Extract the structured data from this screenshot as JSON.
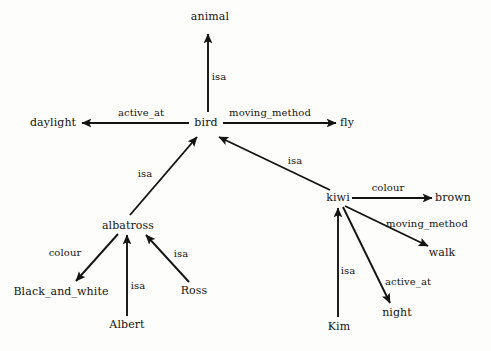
{
  "diagram": {
    "type": "semantic-network",
    "background_color": "#fdfdfb",
    "ink_color": "#141414",
    "nodes": [
      {
        "id": "animal",
        "label": "animal",
        "x": 210,
        "y": 17
      },
      {
        "id": "daylight",
        "label": "daylight",
        "x": 53,
        "y": 123
      },
      {
        "id": "bird",
        "label": "bird",
        "x": 206,
        "y": 123
      },
      {
        "id": "fly",
        "label": "fly",
        "x": 347,
        "y": 123
      },
      {
        "id": "albatross",
        "label": "albatross",
        "x": 128,
        "y": 226
      },
      {
        "id": "kiwi",
        "label": "kiwi",
        "x": 338,
        "y": 198
      },
      {
        "id": "brown",
        "label": "brown",
        "x": 453,
        "y": 198
      },
      {
        "id": "walk",
        "label": "walk",
        "x": 442,
        "y": 253
      },
      {
        "id": "night",
        "label": "night",
        "x": 397,
        "y": 313
      },
      {
        "id": "black_and_white",
        "label": "Black_and_white",
        "x": 61,
        "y": 292
      },
      {
        "id": "ross",
        "label": "Ross",
        "x": 194,
        "y": 291
      },
      {
        "id": "albert",
        "label": "Albert",
        "x": 127,
        "y": 325
      },
      {
        "id": "kim",
        "label": "Kim",
        "x": 339,
        "y": 327
      }
    ],
    "edges": [
      {
        "id": "bird-isa-animal",
        "from": "bird",
        "to": "animal",
        "label": "isa",
        "label_x": 219,
        "label_y": 76,
        "x1": 208,
        "y1": 112,
        "x2": 208,
        "y2": 34
      },
      {
        "id": "bird-activeat-daylight",
        "from": "bird",
        "to": "daylight",
        "label": "active_at",
        "label_x": 141,
        "label_y": 112,
        "x1": 189,
        "y1": 123,
        "x2": 82,
        "y2": 123
      },
      {
        "id": "bird-movingmethod-fly",
        "from": "bird",
        "to": "fly",
        "label": "moving_method",
        "label_x": 270,
        "label_y": 112,
        "x1": 223,
        "y1": 123,
        "x2": 336,
        "y2": 123
      },
      {
        "id": "albatross-isa-bird",
        "from": "albatross",
        "to": "bird",
        "label": "isa",
        "label_x": 145,
        "label_y": 173,
        "x1": 130,
        "y1": 215,
        "x2": 197,
        "y2": 137
      },
      {
        "id": "kiwi-isa-bird",
        "from": "kiwi",
        "to": "bird",
        "label": "isa",
        "label_x": 295,
        "label_y": 160,
        "x1": 330,
        "y1": 190,
        "x2": 219,
        "y2": 137
      },
      {
        "id": "kiwi-colour-brown",
        "from": "kiwi",
        "to": "brown",
        "label": "colour",
        "label_x": 388,
        "label_y": 187,
        "x1": 352,
        "y1": 198,
        "x2": 432,
        "y2": 198
      },
      {
        "id": "kiwi-movingmethod-walk",
        "from": "kiwi",
        "to": "walk",
        "label": "moving_method",
        "label_x": 427,
        "label_y": 223,
        "x1": 345,
        "y1": 206,
        "x2": 428,
        "y2": 246
      },
      {
        "id": "kiwi-activeat-night",
        "from": "kiwi",
        "to": "night",
        "label": "active_at",
        "label_x": 408,
        "label_y": 281,
        "x1": 343,
        "y1": 207,
        "x2": 390,
        "y2": 303
      },
      {
        "id": "kim-isa-kiwi",
        "from": "kim",
        "to": "kiwi",
        "label": "isa",
        "label_x": 348,
        "label_y": 270,
        "x1": 338,
        "y1": 317,
        "x2": 338,
        "y2": 208
      },
      {
        "id": "albatross-colour-blackwhite",
        "from": "albatross",
        "to": "black_and_white",
        "label": "colour",
        "label_x": 65,
        "label_y": 252,
        "x1": 118,
        "y1": 234,
        "x2": 76,
        "y2": 281
      },
      {
        "id": "albert-isa-albatross",
        "from": "albert",
        "to": "albatross",
        "label": "isa",
        "label_x": 138,
        "label_y": 285,
        "x1": 127,
        "y1": 316,
        "x2": 127,
        "y2": 235
      },
      {
        "id": "ross-isa-albatross",
        "from": "ross",
        "to": "albatross",
        "label": "isa",
        "label_x": 181,
        "label_y": 253,
        "x1": 189,
        "y1": 282,
        "x2": 146,
        "y2": 235
      }
    ]
  }
}
